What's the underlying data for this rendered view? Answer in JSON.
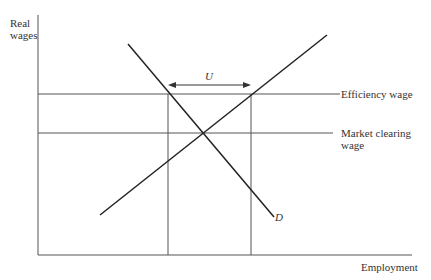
{
  "diagram": {
    "type": "efficiency-wage labor market",
    "y_axis_label_line1": "Real",
    "y_axis_label_line2": "wages",
    "x_axis_label": "Employment",
    "efficiency_wage_label": "Efficiency wage",
    "market_clearing_label_line1": "Market clearing",
    "market_clearing_label_line2": "wage",
    "unemployment_label": "U",
    "demand_label": "D",
    "colors": {
      "line": "#222222",
      "guide": "#555555",
      "background": "#ffffff"
    }
  }
}
